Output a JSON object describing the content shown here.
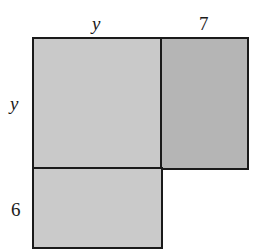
{
  "diagram": {
    "type": "area-model",
    "regions": [
      {
        "id": "square-y-by-y",
        "width_label": "y",
        "height_label": "y",
        "fill": "#c9c9c9"
      },
      {
        "id": "rect-7-by-y",
        "width_label": "7",
        "height_label": "y",
        "fill": "#b5b5b5"
      },
      {
        "id": "rect-y-by-6",
        "width_label": "y",
        "height_label": "6",
        "fill": "#cacaca"
      }
    ],
    "labels": {
      "top_left": "y",
      "top_right": "7",
      "left_top": "y",
      "left_bottom": "6"
    },
    "stroke_color": "#1a1a1a"
  }
}
